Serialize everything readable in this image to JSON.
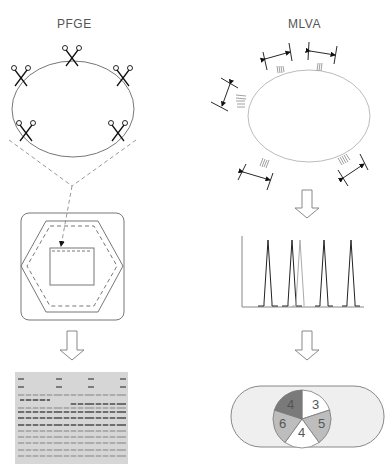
{
  "left_panel": {
    "title": "PFGE",
    "cut_sites": 5,
    "gel_lanes": 16
  },
  "right_panel": {
    "title": "MLVA",
    "vntr_loci": 5,
    "chromatogram_peaks": 6,
    "pie_labels": [
      "3",
      "5",
      "4",
      "6",
      "4"
    ]
  },
  "colors": {
    "line": "#555555",
    "light_line": "#888888",
    "dashed": "#999999",
    "capsule_fill": "#efefef",
    "pie_dark": "#7a7a7a",
    "pie_mid": "#bdbdbd",
    "pie_light": "#ffffff"
  }
}
